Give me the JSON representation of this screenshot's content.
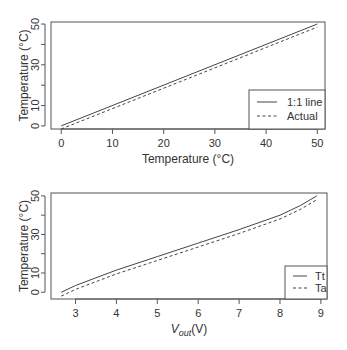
{
  "chart_data": [
    {
      "type": "line",
      "title": "",
      "xlabel": "Temperature (°C)",
      "ylabel": "Temperature (°C)",
      "xlim": [
        -2,
        51.5
      ],
      "ylim": [
        -1.5,
        51
      ],
      "xticks": [
        0,
        10,
        20,
        30,
        40,
        50
      ],
      "yticks": [
        0,
        10,
        20,
        30,
        40,
        50
      ],
      "ytick_labels": [
        "0",
        "10",
        "",
        "30",
        "",
        "50"
      ],
      "grid": false,
      "legend_position": "bottom-right",
      "series": [
        {
          "name": "1:1 line",
          "style": "solid",
          "x": [
            0,
            50
          ],
          "y": [
            0,
            50
          ]
        },
        {
          "name": "Actual",
          "style": "dashed",
          "x": [
            0,
            50
          ],
          "y": [
            -1.5,
            48.5
          ]
        }
      ]
    },
    {
      "type": "line",
      "title": "",
      "xlabel": "Vout(V)",
      "ylabel": "Temperature (°C)",
      "xlim": [
        2.4,
        9.15
      ],
      "ylim": [
        -3.5,
        51.5
      ],
      "xticks": [
        3,
        4,
        5,
        6,
        7,
        8,
        9
      ],
      "yticks": [
        0,
        10,
        20,
        30,
        40,
        50
      ],
      "ytick_labels": [
        "0",
        "10",
        "",
        "30",
        "",
        "50"
      ],
      "grid": false,
      "legend_position": "bottom-right",
      "series": [
        {
          "name": "Tt",
          "style": "solid",
          "x": [
            2.65,
            3,
            4,
            5,
            6,
            7,
            8,
            8.5,
            8.9
          ],
          "y": [
            0,
            3.5,
            11.5,
            18.5,
            25.5,
            32.5,
            40,
            45,
            50
          ]
        },
        {
          "name": "Ta",
          "style": "dashed",
          "x": [
            2.65,
            3,
            4,
            5,
            6,
            7,
            8,
            8.5,
            8.9
          ],
          "y": [
            -2,
            1.5,
            9.5,
            16.5,
            23.5,
            30.5,
            38,
            43,
            48
          ]
        }
      ]
    }
  ],
  "top": {
    "xlabel": "Temperature (°C)",
    "ylabel": "Temperature (°C)",
    "legend": [
      "1:1 line",
      "Actual"
    ]
  },
  "bottom": {
    "xlabel_main": "V",
    "xlabel_sub": "out",
    "xlabel_unit": "(V)",
    "ylabel": "Temperature (°C)",
    "legend": [
      "Tt",
      "Ta"
    ]
  }
}
